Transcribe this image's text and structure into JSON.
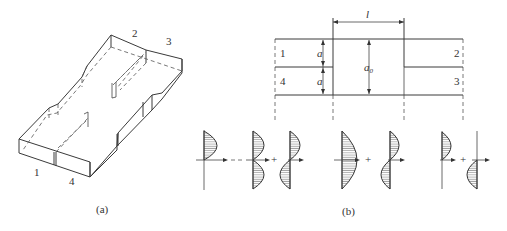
{
  "figure_a": {
    "caption": "(a)",
    "port_labels": {
      "p1": "1",
      "p2": "2",
      "p3": "3",
      "p4": "4"
    }
  },
  "figure_b": {
    "caption": "(b)",
    "dimensions": {
      "length": "l",
      "a_upper": "a",
      "a_lower": "a",
      "a0": "a",
      "a0_sub": "0"
    },
    "port_labels": {
      "p1": "1",
      "p2": "2",
      "p3": "3",
      "p4": "4"
    },
    "operators": {
      "equals": "=",
      "plus1": "+",
      "plus2": "+",
      "plus3": "+"
    }
  }
}
